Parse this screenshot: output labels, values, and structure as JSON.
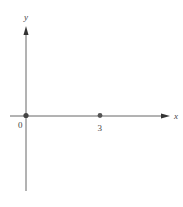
{
  "axes": {
    "x_label": "x",
    "y_label": "y",
    "axis_color": "#666666"
  },
  "points": [
    {
      "label": "0",
      "x": 0,
      "color": "#444444"
    },
    {
      "label": "3",
      "x": 3,
      "color": "#555555"
    }
  ]
}
